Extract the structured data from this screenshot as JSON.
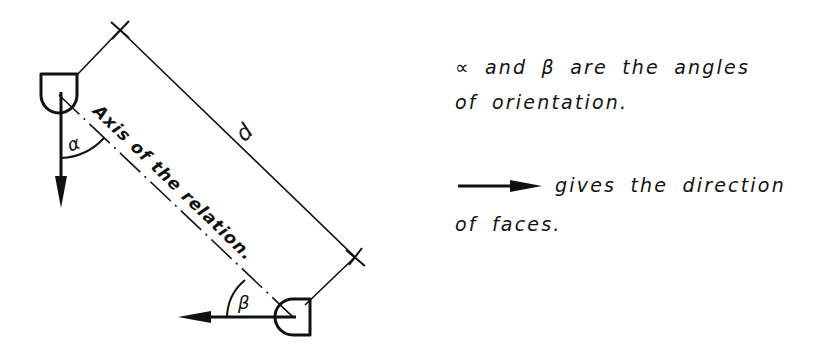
{
  "diagram": {
    "axis_label": "Axis of the relation.",
    "distance_label": "d",
    "angle_alpha_label": "α",
    "angle_beta_label": "β",
    "colors": {
      "ink": "#111111",
      "background": "#ffffff"
    }
  },
  "legend": {
    "line1": "∝ and β are the angles",
    "line2": "of orientation.",
    "line3": "gives the direction",
    "line4": "of faces.",
    "arrow_icon": "right-arrow-icon"
  }
}
